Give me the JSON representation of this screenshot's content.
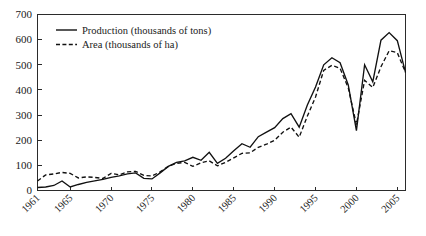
{
  "chart_data": {
    "type": "line",
    "title": "",
    "subtitle": "",
    "xlabel": "",
    "ylabel": "",
    "xlim": [
      1961,
      2006
    ],
    "ylim": [
      0,
      700
    ],
    "grid": false,
    "legend_position": "top-left",
    "y_ticks": [
      0,
      100,
      200,
      300,
      400,
      500,
      600,
      700
    ],
    "y_tick_labels": [
      "0",
      "100",
      "200",
      "300",
      "400",
      "500",
      "600",
      "700"
    ],
    "x_ticks": [
      1961,
      1965,
      1970,
      1975,
      1980,
      1985,
      1990,
      1995,
      2000,
      2005
    ],
    "x_tick_labels": [
      "1961",
      "1965",
      "1970",
      "1975",
      "1980",
      "1985",
      "1990",
      "1995",
      "2000",
      "2005"
    ],
    "x": [
      1961,
      1962,
      1963,
      1964,
      1965,
      1966,
      1967,
      1968,
      1969,
      1970,
      1971,
      1972,
      1973,
      1974,
      1975,
      1976,
      1977,
      1978,
      1979,
      1980,
      1981,
      1982,
      1983,
      1984,
      1985,
      1986,
      1987,
      1988,
      1989,
      1990,
      1991,
      1992,
      1993,
      1994,
      1995,
      1996,
      1997,
      1998,
      1999,
      2000,
      2001,
      2002,
      2003,
      2004,
      2005,
      2006
    ],
    "series": [
      {
        "name": "Production (thousands of tons)",
        "style": "solid",
        "color": "#111111",
        "values": [
          12,
          14,
          20,
          38,
          14,
          24,
          32,
          38,
          44,
          52,
          58,
          66,
          70,
          48,
          46,
          70,
          96,
          112,
          118,
          132,
          120,
          152,
          108,
          128,
          158,
          186,
          172,
          214,
          232,
          250,
          286,
          306,
          252,
          340,
          412,
          500,
          528,
          508,
          420,
          238,
          500,
          432,
          598,
          628,
          596,
          470
        ]
      },
      {
        "name": "Area (thousands of ha)",
        "style": "dashed",
        "color": "#111111",
        "values": [
          38,
          62,
          66,
          72,
          68,
          50,
          54,
          52,
          48,
          68,
          62,
          74,
          76,
          60,
          58,
          74,
          96,
          108,
          112,
          96,
          110,
          118,
          98,
          112,
          130,
          148,
          150,
          172,
          184,
          200,
          232,
          252,
          212,
          296,
          372,
          478,
          498,
          486,
          408,
          262,
          438,
          410,
          492,
          556,
          548,
          470
        ]
      }
    ]
  },
  "legend": {
    "items": [
      {
        "label": "Production (thousands of tons)",
        "style": "solid"
      },
      {
        "label": "Area (thousands of ha)",
        "style": "dashed"
      }
    ]
  }
}
